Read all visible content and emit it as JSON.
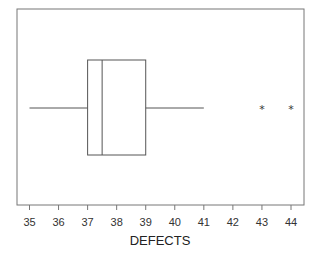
{
  "chart_data": {
    "type": "boxplot",
    "title": "",
    "xlabel": "DEFECTS",
    "ylabel": "",
    "xlim": [
      34.6,
      44.5
    ],
    "ticks": [
      35,
      36,
      37,
      38,
      39,
      40,
      41,
      42,
      43,
      44
    ],
    "tick_labels": [
      "35",
      "36",
      "37",
      "38",
      "39",
      "40",
      "41",
      "42",
      "43",
      "44"
    ],
    "grid": false,
    "orientation": "horizontal",
    "series": [
      {
        "name": "DEFECTS",
        "whisker_low": 35,
        "q1": 37,
        "median": 37.5,
        "q3": 39,
        "whisker_high": 41,
        "outliers": [
          43,
          44
        ],
        "outlier_marker": "*"
      }
    ]
  },
  "colors": {
    "line": "#555555",
    "frame": "#666666",
    "background": "#ffffff"
  }
}
